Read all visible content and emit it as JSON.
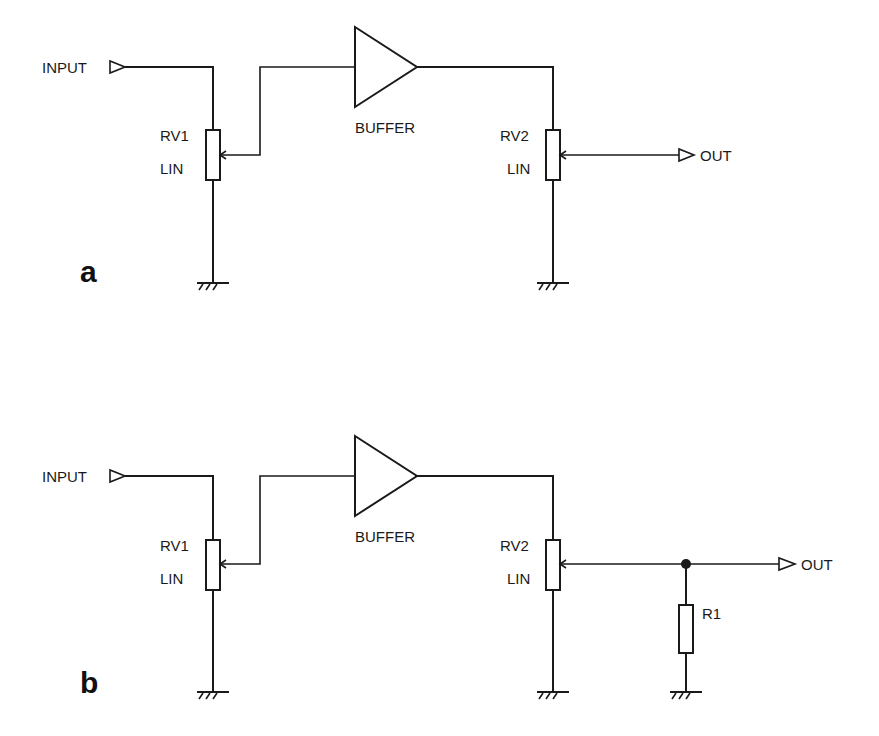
{
  "diagrams": [
    {
      "panel_label": "a",
      "input_label": "INPUT",
      "output_label": "OUT",
      "buffer_label": "BUFFER",
      "rv1": {
        "name": "RV1",
        "taper": "LIN"
      },
      "rv2": {
        "name": "RV2",
        "taper": "LIN"
      }
    },
    {
      "panel_label": "b",
      "input_label": "INPUT",
      "output_label": "OUT",
      "buffer_label": "BUFFER",
      "rv1": {
        "name": "RV1",
        "taper": "LIN"
      },
      "rv2": {
        "name": "RV2",
        "taper": "LIN"
      },
      "r1": {
        "name": "R1"
      }
    }
  ],
  "colors": {
    "line": "#1a1a1a",
    "background": "#ffffff"
  }
}
